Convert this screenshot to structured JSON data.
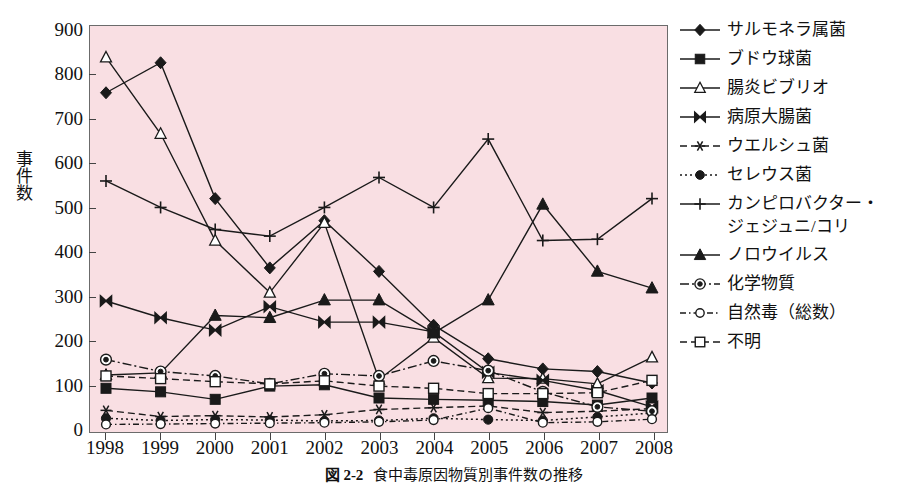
{
  "figure": {
    "caption_number": "図 2-2",
    "caption_text": "食中毒原因物質別事件数の推移"
  },
  "axes": {
    "y_title": "事件数",
    "y_ticks": [
      0,
      100,
      200,
      300,
      400,
      500,
      600,
      700,
      800,
      900
    ],
    "x_ticks": [
      "1998",
      "1999",
      "2000",
      "2001",
      "2002",
      "2003",
      "2004",
      "2005",
      "2006",
      "2007",
      "2008"
    ]
  },
  "style": {
    "plot_background": "#f9dfe3",
    "plot_border": "#6b6b6b",
    "line_color": "#1a1a1a",
    "page_background": "#ffffff"
  },
  "chart_data": {
    "type": "line",
    "title": "食中毒原因物質別事件数の推移",
    "xlabel": "",
    "ylabel": "事件数",
    "ylim": [
      0,
      900
    ],
    "grid": false,
    "legend_position": "right",
    "x": [
      "1998",
      "1999",
      "2000",
      "2001",
      "2002",
      "2003",
      "2004",
      "2005",
      "2006",
      "2007",
      "2008"
    ],
    "series": [
      {
        "name": "サルモネラ属菌",
        "marker": "filled-diamond",
        "line": "solid",
        "values": [
          760,
          828,
          520,
          363,
          470,
          355,
          233,
          157,
          134,
          128,
          102
        ]
      },
      {
        "name": "ブドウ球菌",
        "marker": "filled-square",
        "line": "solid",
        "values": [
          90,
          82,
          65,
          95,
          98,
          68,
          65,
          63,
          60,
          52,
          68
        ]
      },
      {
        "name": "腸炎ビブリオ",
        "marker": "open-triangle",
        "line": "solid",
        "values": [
          840,
          667,
          425,
          307,
          465,
          110,
          205,
          113,
          112,
          100,
          160
        ]
      },
      {
        "name": "病原大腸菌",
        "marker": "bowtie",
        "line": "solid",
        "values": [
          288,
          250,
          222,
          275,
          240,
          240,
          218,
          126,
          108,
          85,
          48
        ]
      },
      {
        "name": "ウエルシュ菌",
        "marker": "asterisk",
        "line": "dashed",
        "values": [
          40,
          26,
          28,
          25,
          30,
          42,
          46,
          50,
          35,
          38,
          44
        ]
      },
      {
        "name": "セレウス菌",
        "marker": "filled-circle",
        "line": "dotted",
        "values": [
          22,
          17,
          19,
          18,
          16,
          17,
          22,
          19,
          17,
          25,
          34
        ]
      },
      {
        "name": "カンピロバクター・\nジェジュニ/コリ",
        "marker": "plus",
        "line": "solid",
        "values": [
          560,
          500,
          450,
          435,
          500,
          568,
          500,
          655,
          425,
          428,
          520
        ]
      },
      {
        "name": "ノロウイルス",
        "marker": "filled-triangle",
        "line": "solid",
        "values": [
          120,
          125,
          255,
          250,
          290,
          290,
          215,
          290,
          507,
          355,
          317
        ]
      },
      {
        "name": "化学物質",
        "marker": "double-circle",
        "line": "dash-dot",
        "values": [
          155,
          128,
          118,
          100,
          123,
          118,
          152,
          130,
          82,
          48,
          38
        ]
      },
      {
        "name": "自然毒（総数）",
        "marker": "open-circle",
        "line": "dash-dot-thin",
        "values": [
          8,
          9,
          10,
          11,
          12,
          14,
          18,
          45,
          12,
          14,
          20
        ]
      },
      {
        "name": "不明",
        "marker": "open-square",
        "line": "dashed",
        "values": [
          118,
          112,
          105,
          100,
          107,
          95,
          90,
          78,
          78,
          80,
          108
        ]
      }
    ]
  }
}
